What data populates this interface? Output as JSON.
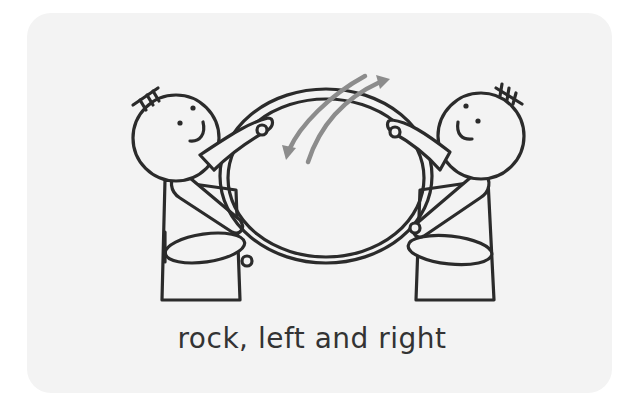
{
  "card": {
    "background": "#f3f3f3"
  },
  "illustration": {
    "description": "Two stick figures seated facing each other holding a hoop, with gray arrows indicating rocking motion",
    "arrow_color": "#8c8c8c",
    "ink_color": "#2b2b2b"
  },
  "caption": {
    "text": "rock, left and right"
  }
}
